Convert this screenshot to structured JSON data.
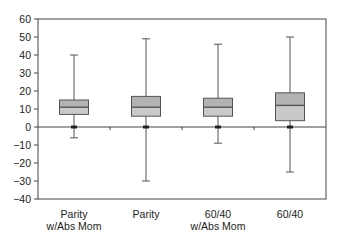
{
  "chart_data": {
    "type": "box",
    "title": "",
    "xlabel": "",
    "ylabel": "",
    "ylim": [
      -40,
      60
    ],
    "yticks": [
      60,
      50,
      40,
      30,
      20,
      10,
      0,
      -10,
      -20,
      -30,
      -40
    ],
    "grid": false,
    "legend": null,
    "categories": [
      {
        "line1": "Parity",
        "line2": "w/Abs Mom"
      },
      {
        "line1": "Parity",
        "line2": ""
      },
      {
        "line1": "60/40",
        "line2": "w/Abs Mom"
      },
      {
        "line1": "60/40",
        "line2": ""
      }
    ],
    "series": [
      {
        "name": "Parity w/Abs Mom",
        "whisker_low": -6,
        "q1": 7,
        "median": 11,
        "q3": 15,
        "whisker_high": 40
      },
      {
        "name": "Parity",
        "whisker_low": -30,
        "q1": 6,
        "median": 11,
        "q3": 17,
        "whisker_high": 49
      },
      {
        "name": "60/40 w/Abs Mom",
        "whisker_low": -9,
        "q1": 6,
        "median": 11,
        "q3": 16,
        "whisker_high": 46
      },
      {
        "name": "60/40",
        "whisker_low": -25,
        "q1": 3.5,
        "median": 12,
        "q3": 19,
        "whisker_high": 50
      }
    ]
  },
  "colors": {
    "box_fill_lower": "#c9c9c9",
    "box_fill_upper": "#b3b3b3",
    "line": "#555555",
    "axis": "#444444",
    "background": "#ffffff"
  }
}
